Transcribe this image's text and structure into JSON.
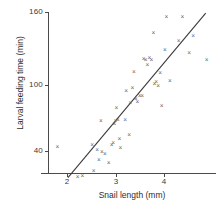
{
  "chart_data": {
    "type": "scatter",
    "title": "",
    "xlabel": "Snail length (mm)",
    "ylabel": "Larval feeding time (min)",
    "xlim": [
      1.45,
      5.0
    ],
    "ylim": [
      18,
      168
    ],
    "xticks": [
      2,
      3,
      4
    ],
    "xtick_labels": [
      "2",
      "3",
      "4"
    ],
    "yticks": [
      40,
      100,
      160
    ],
    "ytick_labels": [
      "40",
      "100",
      "160"
    ],
    "grid": false,
    "legend": "none",
    "marker": "x",
    "marker_color": "#6a6a6a",
    "line_color": "#3a3a3a",
    "axis_color": "#4a4a4a",
    "series": [
      {
        "name": "Snail larvae",
        "points": [
          [
            1.8,
            47
          ],
          [
            2.22,
            21
          ],
          [
            2.32,
            22
          ],
          [
            2.52,
            49
          ],
          [
            2.55,
            26
          ],
          [
            2.62,
            44
          ],
          [
            2.66,
            36
          ],
          [
            2.7,
            69
          ],
          [
            2.72,
            43
          ],
          [
            2.78,
            41
          ],
          [
            2.86,
            33
          ],
          [
            2.92,
            49
          ],
          [
            2.95,
            50
          ],
          [
            2.98,
            67
          ],
          [
            3.0,
            69
          ],
          [
            3.02,
            81
          ],
          [
            3.05,
            70
          ],
          [
            3.08,
            54
          ],
          [
            3.1,
            46
          ],
          [
            3.2,
            70
          ],
          [
            3.22,
            95
          ],
          [
            3.28,
            57
          ],
          [
            3.3,
            85
          ],
          [
            3.35,
            98
          ],
          [
            3.38,
            112
          ],
          [
            3.42,
            88
          ],
          [
            3.45,
            86
          ],
          [
            3.5,
            91
          ],
          [
            3.55,
            91
          ],
          [
            3.58,
            123
          ],
          [
            3.62,
            122
          ],
          [
            3.66,
            118
          ],
          [
            3.7,
            124
          ],
          [
            3.74,
            122
          ],
          [
            3.78,
            145
          ],
          [
            3.8,
            101
          ],
          [
            3.84,
            103
          ],
          [
            3.88,
            100
          ],
          [
            3.92,
            111
          ],
          [
            3.95,
            82
          ],
          [
            4.02,
            131
          ],
          [
            4.05,
            159
          ],
          [
            4.12,
            104
          ],
          [
            4.3,
            138
          ],
          [
            4.38,
            159
          ],
          [
            4.52,
            128
          ],
          [
            4.6,
            143
          ],
          [
            4.88,
            122
          ]
        ]
      }
    ],
    "fit_line": {
      "name": "regression line",
      "x_start": 2.02,
      "y_start": 20,
      "x_end": 4.86,
      "y_end": 162
    }
  }
}
